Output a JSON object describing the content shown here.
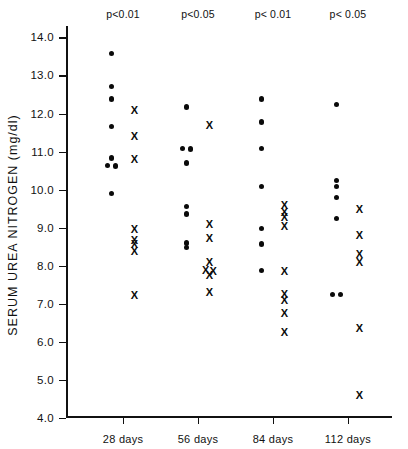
{
  "chart_data": {
    "type": "scatter",
    "title": "",
    "xlabel": "",
    "ylabel": "SERUM UREA NITROGEN  (mg/dl)",
    "ylim": [
      4.0,
      14.3
    ],
    "ytick_labels": [
      "14.0",
      "13.0",
      "12.0",
      "11.0",
      "10.0",
      "9.0",
      "8.0",
      "7.0",
      "6.0",
      "5.0",
      "4.0"
    ],
    "ytick_values": [
      14.0,
      13.0,
      12.0,
      11.0,
      10.0,
      9.0,
      8.0,
      7.0,
      6.0,
      5.0,
      4.0
    ],
    "grid": false,
    "legend_position": "none",
    "categories": [
      "28 days",
      "56 days",
      "84 days",
      "112 days"
    ],
    "annotations": [
      "p<0.01",
      "p<0.05",
      "p< 0.01",
      "p< 0.05"
    ],
    "groups": [
      {
        "category": "28 days",
        "annotation": "p<0.01",
        "series": [
          {
            "name": "control",
            "marker": "dot",
            "values": [
              13.58,
              12.72,
              12.38,
              11.65,
              10.83,
              10.64,
              10.62,
              9.9
            ]
          },
          {
            "name": "treated",
            "marker": "x",
            "values": [
              12.08,
              11.4,
              10.8,
              8.97,
              8.68,
              8.58,
              8.4,
              7.22
            ]
          }
        ]
      },
      {
        "category": "56 days",
        "annotation": "p<0.05",
        "series": [
          {
            "name": "control",
            "marker": "dot",
            "values": [
              12.17,
              11.08,
              11.07,
              10.7,
              9.56,
              9.36,
              8.6,
              8.47
            ]
          },
          {
            "name": "treated",
            "marker": "x",
            "values": [
              11.7,
              9.1,
              8.72,
              8.1,
              7.88,
              7.86,
              7.76,
              7.32
            ]
          }
        ]
      },
      {
        "category": "84 days",
        "annotation": "p< 0.01",
        "series": [
          {
            "name": "control",
            "marker": "dot",
            "values": [
              12.38,
              11.78,
              11.08,
              10.08,
              8.97,
              8.57,
              7.88
            ]
          },
          {
            "name": "treated",
            "marker": "x",
            "values": [
              9.6,
              9.4,
              9.28,
              9.05,
              7.86,
              7.26,
              7.1,
              6.76,
              6.26
            ]
          }
        ]
      },
      {
        "category": "112 days",
        "annotation": "p< 0.05",
        "series": [
          {
            "name": "control",
            "marker": "dot",
            "values": [
              12.24,
              10.24,
              10.08,
              9.8,
              9.25,
              7.25,
              7.25
            ]
          },
          {
            "name": "treated",
            "marker": "x",
            "values": [
              9.48,
              8.8,
              8.32,
              8.1,
              6.36,
              4.6
            ]
          }
        ]
      }
    ],
    "group_x_positions": [
      0.175,
      0.405,
      0.635,
      0.865
    ],
    "series_x_offsets": {
      "control": -0.035,
      "treated": 0.035
    }
  }
}
